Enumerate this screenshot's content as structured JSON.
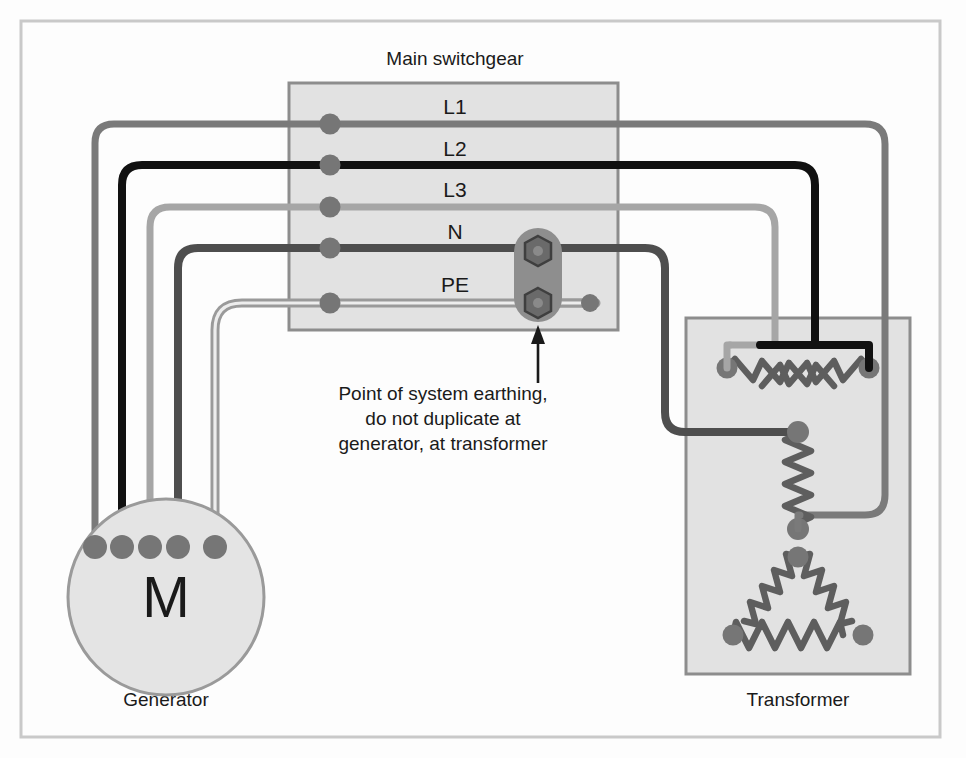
{
  "diagram": {
    "title_switchgear": "Main switchgear",
    "title_generator": "Generator",
    "title_transformer": "Transformer",
    "generator_symbol": "M",
    "bus_labels": [
      {
        "id": "L1",
        "label": "L1"
      },
      {
        "id": "L2",
        "label": "L2"
      },
      {
        "id": "L3",
        "label": "L3"
      },
      {
        "id": "N",
        "label": "N"
      },
      {
        "id": "PE",
        "label": "PE"
      }
    ],
    "annotation": {
      "line1": "Point of system earthing,",
      "line2": "do not duplicate at",
      "line3": "generator, at transformer"
    },
    "colors": {
      "background": "#fdfdfd",
      "frame_border": "#c9c9c9",
      "box_fill": "#e2e2e2",
      "box_border": "#8d8d8d",
      "conductor_L1": "#7a7a7a",
      "conductor_L2": "#111111",
      "conductor_L3": "#a6a6a6",
      "conductor_N": "#4e4e4e",
      "conductor_PE": "#9a9a9a",
      "node_dot": "#767676",
      "winding": "#5e5e5e",
      "terminal_block": "#8e8e8e",
      "bolt": "#6a6a6a",
      "text": "#1a1a1a"
    }
  }
}
